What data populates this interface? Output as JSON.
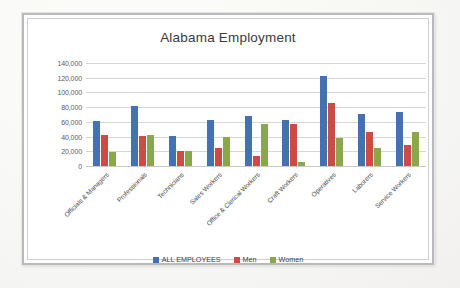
{
  "frame": {
    "border_color": "#b9b9bb",
    "background": "#ffffff"
  },
  "chart_data": {
    "type": "bar",
    "title": "Alabama Employment",
    "xlabel": "",
    "ylabel": "",
    "ylim": [
      0,
      140000
    ],
    "ytick_step": 20000,
    "grid": true,
    "legend_position": "bottom",
    "ytick_labels": [
      "140,000",
      "120,000",
      "100,000",
      "80,000",
      "60,000",
      "40,000",
      "20,000",
      "0"
    ],
    "yticks": [
      140000,
      120000,
      100000,
      80000,
      60000,
      40000,
      20000,
      0
    ],
    "categories": [
      "Officials & Managers",
      "Professionals",
      "Technicians",
      "Sales Workers",
      "Office & Clerical Workers",
      "Craft Workers",
      "Operatives",
      "Laborers",
      "Service Workers"
    ],
    "series": [
      {
        "name": "ALL EMPLOYEES",
        "color": "#4472b0",
        "values": [
          61000,
          81000,
          41000,
          63000,
          68000,
          63000,
          122000,
          71000,
          74000
        ]
      },
      {
        "name": "Men",
        "color": "#cc4b45",
        "values": [
          42000,
          41000,
          21000,
          25000,
          13000,
          57000,
          86000,
          46000,
          29000
        ]
      },
      {
        "name": "Women",
        "color": "#8aa84b",
        "values": [
          19000,
          42000,
          21000,
          40000,
          57000,
          6000,
          38000,
          25000,
          46000
        ]
      }
    ]
  }
}
